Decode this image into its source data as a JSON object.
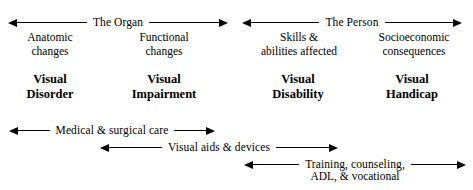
{
  "diagram": {
    "top_arrows": [
      {
        "id": "organ",
        "label": "The Organ",
        "left_head": true,
        "right_head": true
      },
      {
        "id": "person",
        "label": "The Person",
        "left_head": true,
        "right_head": true
      }
    ],
    "descriptors": [
      {
        "id": "anatomic",
        "line1": "Anatomic",
        "line2": "changes"
      },
      {
        "id": "functional",
        "line1": "Functional",
        "line2": "changes"
      },
      {
        "id": "skills",
        "line1": "Skills &",
        "line2": "abilities affected"
      },
      {
        "id": "socio",
        "line1": "Socioeconomic",
        "line2": "consequences"
      }
    ],
    "stages": [
      {
        "id": "disorder",
        "line1": "Visual",
        "line2": "Disorder"
      },
      {
        "id": "impairment",
        "line1": "Visual",
        "line2": "Impairment"
      },
      {
        "id": "disability",
        "line1": "Visual",
        "line2": "Disability"
      },
      {
        "id": "handicap",
        "line1": "Visual",
        "line2": "Handicap"
      }
    ],
    "interventions": [
      {
        "id": "medical",
        "label": "Medical & surgical care",
        "sub": ""
      },
      {
        "id": "aids",
        "label": "Visual aids & devices",
        "sub": ""
      },
      {
        "id": "training",
        "label": "Training, counseling,",
        "sub": "ADL, & vocational"
      }
    ],
    "colors": {
      "background": "#ffffff",
      "ink": "#000000"
    }
  }
}
